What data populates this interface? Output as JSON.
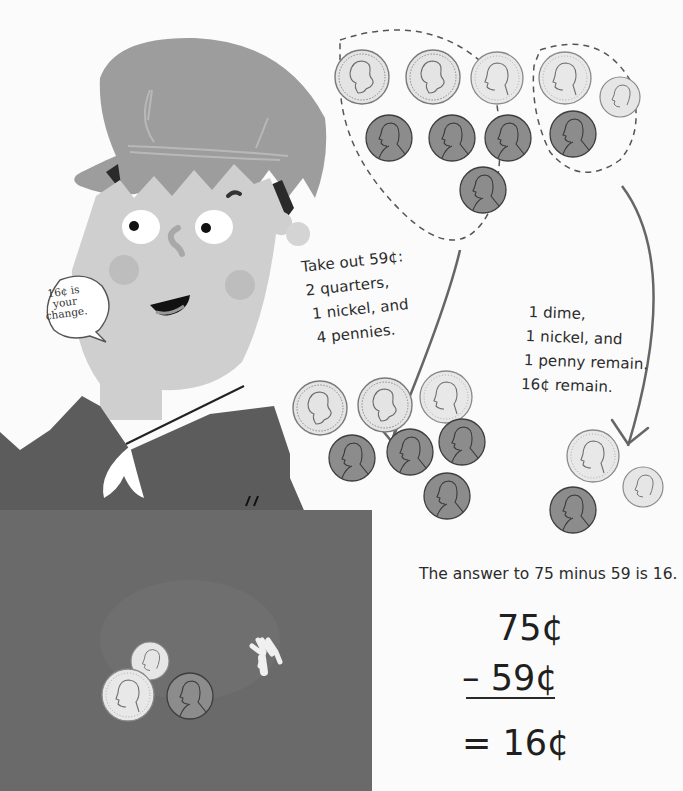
{
  "speech_bubble": {
    "lines": [
      "16¢ is",
      "your",
      "change."
    ]
  },
  "take_out_note": {
    "lines": [
      "Take out 59¢:",
      "2 quarters,",
      "1 nickel, and",
      "4 pennies."
    ]
  },
  "remain_note": {
    "lines": [
      "1 dime,",
      "1 nickel, and",
      "1 penny remain.",
      "16¢ remain."
    ]
  },
  "answer_sentence": "The answer to 75 minus 59 is 16.",
  "equation": {
    "minuend": "75¢",
    "subtrahend": "– 59¢",
    "result": "= 16¢"
  },
  "coin_groups": {
    "start_group_take": [
      "quarter",
      "quarter",
      "nickel",
      "penny",
      "penny",
      "penny",
      "penny"
    ],
    "start_group_keep": [
      "nickel",
      "dime",
      "penny"
    ],
    "taken_out": [
      "quarter",
      "quarter",
      "nickel",
      "penny",
      "penny",
      "penny",
      "penny"
    ],
    "remaining": [
      "nickel",
      "dime",
      "penny"
    ],
    "on_counter": [
      "dime",
      "nickel",
      "penny"
    ]
  },
  "colors": {
    "background": "#fbfbfb",
    "hat": "#9e9e9e",
    "face": "#cfcfcf",
    "jacket": "#5f5f5f",
    "counter": "#6a6a6a",
    "silver_coin": "#e2e2e2",
    "penny": "#8a8a8a",
    "text": "#2b2b2b"
  }
}
